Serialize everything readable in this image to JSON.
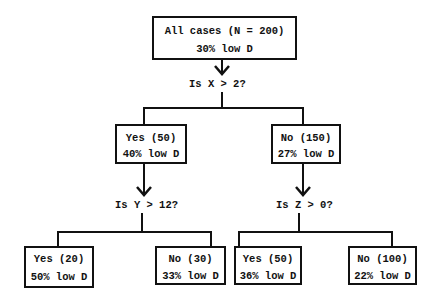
{
  "root": {
    "line1": "All cases (N = 200)",
    "line2": "30% low D"
  },
  "split1": {
    "question": "Is X > 2?"
  },
  "level1": {
    "yes": {
      "line1": "Yes (50)",
      "line2": "40% low D"
    },
    "no": {
      "line1": "No (150)",
      "line2": "27% low D"
    }
  },
  "split2_left": {
    "question": "Is Y > 12?"
  },
  "split2_right": {
    "question": "Is Z > 0?"
  },
  "level2": {
    "left_yes": {
      "line1": "Yes (20)",
      "line2": "50% low D"
    },
    "left_no": {
      "line1": "No (30)",
      "line2": "33% low D"
    },
    "right_yes": {
      "line1": "Yes (50)",
      "line2": "36% low D"
    },
    "right_no": {
      "line1": "No (100)",
      "line2": "22% low D"
    }
  }
}
